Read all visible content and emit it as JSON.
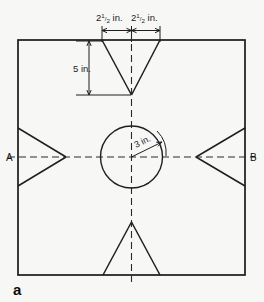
{
  "figure": {
    "id": "a",
    "caption_letter": "a",
    "background_color": "#f7f7f6",
    "line_color": "#1f1f1f"
  },
  "dimensions": [
    {
      "name": "top-left-notch-half-width",
      "whole": "2",
      "numerator": "1",
      "denominator": "2",
      "unit": "in.",
      "text": "2½ in."
    },
    {
      "name": "top-right-notch-half-width",
      "whole": "2",
      "numerator": "1",
      "denominator": "2",
      "unit": "in.",
      "text": "2½ in."
    },
    {
      "name": "top-notch-depth",
      "text": "5 in."
    },
    {
      "name": "circle-radius",
      "text": "3 in."
    }
  ],
  "points": [
    {
      "name": "point-a",
      "label": "A"
    },
    {
      "name": "point-b",
      "label": "B"
    }
  ],
  "geometry": {
    "square": {
      "x": 18,
      "y": 40,
      "width": 227,
      "height": 235
    },
    "circle": {
      "cx": 131.5,
      "cy": 157,
      "r": 31
    },
    "center_horizontal_line_y": 157,
    "center_vertical_line_x": 131.5,
    "top_notch": {
      "left_x": 102,
      "right_x": 160,
      "apex_x": 131.5,
      "apex_y": 95
    },
    "bottom_notch": {
      "left_x": 103,
      "right_x": 160,
      "apex_x": 131.5,
      "apex_y": 222
    },
    "left_notch": {
      "top_y": 128,
      "bottom_y": 186,
      "apex_x": 66,
      "apex_y": 157
    },
    "right_notch": {
      "top_y": 128,
      "bottom_y": 186,
      "apex_x": 196,
      "apex_y": 157
    }
  }
}
